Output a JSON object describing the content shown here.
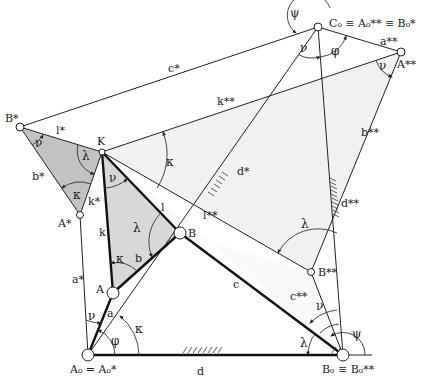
{
  "diagram": {
    "type": "Roberts-Chebyshev cognate linkage construction",
    "colors": {
      "line": "#222222",
      "light_fill": "#f0f0f0",
      "mid_fill": "#d6d6d6",
      "dark_fill": "#bdbdbd",
      "joint_fill": "#ffffff"
    },
    "points": {
      "A0": {
        "label_main": "A",
        "label": "A₀ = A₀*"
      },
      "B0": {
        "label": "B₀ ≡ B₀**"
      },
      "C0": {
        "label": "C₀ ≡ A₀** ≡ B₀*"
      },
      "A_star_star": {
        "label": "A**"
      },
      "B_star": {
        "label": "B*"
      },
      "K": {
        "label": "K"
      },
      "A_star": {
        "label": "A*"
      },
      "A": {
        "label": "A"
      },
      "B": {
        "label": "B"
      },
      "B_star_star": {
        "label": "B**"
      }
    },
    "links": {
      "a": "a",
      "b": "b",
      "c": "c",
      "d": "d",
      "k": "k",
      "l": "l",
      "a_star": "a*",
      "b_star": "b*",
      "c_star": "c*",
      "d_star": "d*",
      "k_star": "k*",
      "l_star": "l*",
      "a_star_star": "a**",
      "b_star_star": "b**",
      "c_star_star": "c**",
      "d_star_star": "d**",
      "k_star_star": "k**",
      "l_star_star": "l**"
    },
    "angles": {
      "psi": "ψ",
      "nu": "ν",
      "phi": "φ",
      "kappa": "κ",
      "lambda": "λ"
    }
  }
}
